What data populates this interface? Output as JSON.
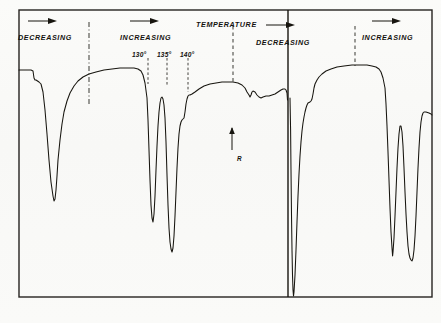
{
  "figure": {
    "title": "TEMPERATURE",
    "medium": "chart-recorder-trace",
    "ink_color": "#17150f",
    "paper_color": "#fbfbf9",
    "frame_color": "#262320"
  },
  "annotations": {
    "direction_labels": [
      {
        "id": "dec-1",
        "text": "DECREASING",
        "x": 18,
        "y": 33,
        "arrow_x": 50,
        "arrow_y": 21
      },
      {
        "id": "inc-1",
        "text": "INCREASING",
        "x": 120,
        "y": 33,
        "arrow_x": 152,
        "arrow_y": 21
      },
      {
        "id": "dec-2",
        "text": "DECREASING",
        "x": 256,
        "y": 38,
        "arrow_x": 288,
        "arrow_y": 25
      },
      {
        "id": "inc-2",
        "text": "INCREASING",
        "x": 362,
        "y": 33,
        "arrow_x": 394,
        "arrow_y": 21
      }
    ],
    "title_label": {
      "text": "TEMPERATURE",
      "x": 196,
      "y": 20
    },
    "temperature_marks": [
      {
        "label": "130°",
        "x": 132,
        "y": 51,
        "tick_x": 148,
        "tick_top": 58,
        "tick_bottom": 84
      },
      {
        "label": "135°",
        "x": 157,
        "y": 51,
        "tick_x": 167,
        "tick_top": 58,
        "tick_bottom": 86
      },
      {
        "label": "140°",
        "x": 180,
        "y": 51,
        "tick_x": 188,
        "tick_top": 58,
        "tick_bottom": 92
      }
    ],
    "sensitivity_marker": {
      "label": "R",
      "label_x": 237,
      "label_y": 155,
      "arrow_x": 232,
      "arrow_top": 128,
      "arrow_bottom": 150
    }
  },
  "chart_data": {
    "type": "line",
    "title": "TEMPERATURE",
    "subtitle": "",
    "xlabel": "",
    "ylabel": "",
    "grid": false,
    "legend": null,
    "xlim": [
      19,
      432
    ],
    "ylim": [
      298,
      60
    ],
    "axis_note": "y axis inverted: pen deflection downward = larger value",
    "annotation_texts": [
      "DECREASING",
      "INCREASING",
      "TEMPERATURE",
      "DECREASING",
      "INCREASING",
      "130°",
      "135°",
      "140°",
      "R"
    ],
    "series": [
      {
        "name": "recorder-trace-left-panel",
        "points": [
          [
            19,
            70
          ],
          [
            22,
            70
          ],
          [
            27,
            70
          ],
          [
            31,
            70
          ],
          [
            33,
            71
          ],
          [
            34,
            78
          ],
          [
            35,
            80
          ],
          [
            36,
            80
          ],
          [
            39,
            82
          ],
          [
            41,
            84
          ],
          [
            43,
            92
          ],
          [
            45,
            110
          ],
          [
            47,
            134
          ],
          [
            49,
            160
          ],
          [
            51,
            182
          ],
          [
            53,
            196
          ],
          [
            54,
            201
          ],
          [
            55,
            199
          ],
          [
            56,
            190
          ],
          [
            57,
            176
          ],
          [
            58,
            160
          ],
          [
            60,
            140
          ],
          [
            62,
            124
          ],
          [
            64,
            112
          ],
          [
            67,
            101
          ],
          [
            70,
            93
          ],
          [
            74,
            86
          ],
          [
            78,
            81
          ],
          [
            83,
            77
          ],
          [
            89,
            74
          ],
          [
            96,
            72
          ],
          [
            104,
            70
          ],
          [
            112,
            69
          ],
          [
            120,
            68
          ],
          [
            128,
            68
          ],
          [
            134,
            68
          ],
          [
            138,
            69
          ],
          [
            141,
            71
          ],
          [
            143,
            75
          ],
          [
            145,
            83
          ],
          [
            147,
            98
          ],
          [
            148,
            120
          ],
          [
            149,
            150
          ],
          [
            150,
            180
          ],
          [
            151,
            205
          ],
          [
            152,
            218
          ],
          [
            153,
            222
          ],
          [
            154,
            214
          ],
          [
            155,
            196
          ],
          [
            156,
            170
          ],
          [
            157,
            146
          ],
          [
            158,
            126
          ],
          [
            159,
            112
          ],
          [
            160,
            103
          ],
          [
            161,
            98
          ],
          [
            162,
            97
          ],
          [
            163,
            99
          ],
          [
            164,
            105
          ],
          [
            165,
            118
          ],
          [
            166,
            142
          ],
          [
            167,
            175
          ],
          [
            168,
            205
          ],
          [
            169,
            228
          ],
          [
            170,
            242
          ],
          [
            171,
            249
          ],
          [
            172,
            252
          ],
          [
            173,
            248
          ],
          [
            174,
            236
          ],
          [
            175,
            216
          ],
          [
            176,
            192
          ],
          [
            177,
            168
          ],
          [
            178,
            148
          ],
          [
            179,
            134
          ],
          [
            180,
            126
          ],
          [
            181,
            122
          ],
          [
            182,
            120
          ],
          [
            183,
            119
          ],
          [
            184,
            118
          ],
          [
            185,
            112
          ],
          [
            186,
            104
          ],
          [
            187,
            99
          ],
          [
            188,
            96
          ],
          [
            189,
            95
          ],
          [
            190,
            95
          ],
          [
            192,
            94
          ],
          [
            195,
            92
          ],
          [
            199,
            89
          ],
          [
            204,
            86
          ],
          [
            210,
            84
          ],
          [
            216,
            83
          ],
          [
            222,
            82
          ],
          [
            228,
            82
          ],
          [
            233,
            82
          ],
          [
            238,
            83
          ],
          [
            242,
            85
          ],
          [
            245,
            88
          ],
          [
            247,
            92
          ],
          [
            249,
            95
          ],
          [
            250,
            97
          ],
          [
            251,
            95
          ],
          [
            252,
            92
          ],
          [
            253,
            91
          ],
          [
            255,
            92
          ],
          [
            257,
            95
          ],
          [
            259,
            97
          ],
          [
            261,
            98
          ],
          [
            263,
            97
          ],
          [
            266,
            96
          ],
          [
            269,
            96
          ],
          [
            272,
            95
          ],
          [
            275,
            94
          ],
          [
            278,
            92
          ],
          [
            281,
            90
          ],
          [
            283,
            89
          ],
          [
            285,
            89
          ],
          [
            286,
            90
          ],
          [
            287,
            93
          ],
          [
            287.5,
            100
          ]
        ]
      },
      {
        "name": "recorder-trace-right-panel",
        "points": [
          [
            290,
            98
          ],
          [
            290.6,
            130
          ],
          [
            291,
            170
          ],
          [
            291.5,
            215
          ],
          [
            292,
            250
          ],
          [
            292.5,
            275
          ],
          [
            293,
            290
          ],
          [
            293.5,
            296
          ],
          [
            294,
            292
          ],
          [
            295,
            275
          ],
          [
            296,
            250
          ],
          [
            297,
            222
          ],
          [
            298,
            196
          ],
          [
            299,
            174
          ],
          [
            300,
            156
          ],
          [
            301,
            142
          ],
          [
            302,
            131
          ],
          [
            303,
            123
          ],
          [
            304,
            117
          ],
          [
            305,
            112
          ],
          [
            306,
            108
          ],
          [
            307,
            105
          ],
          [
            308,
            103
          ],
          [
            310,
            102
          ],
          [
            311,
            101
          ],
          [
            312,
            99
          ],
          [
            313,
            94
          ],
          [
            314,
            88
          ],
          [
            315,
            84
          ],
          [
            317,
            80
          ],
          [
            319,
            77
          ],
          [
            322,
            74
          ],
          [
            326,
            71
          ],
          [
            331,
            69
          ],
          [
            337,
            67
          ],
          [
            344,
            66
          ],
          [
            352,
            65
          ],
          [
            360,
            65
          ],
          [
            367,
            65
          ],
          [
            372,
            66
          ],
          [
            376,
            67
          ],
          [
            379,
            69
          ],
          [
            381,
            72
          ],
          [
            383,
            78
          ],
          [
            385,
            88
          ],
          [
            386,
            104
          ],
          [
            387,
            126
          ],
          [
            388,
            152
          ],
          [
            389,
            180
          ],
          [
            390,
            208
          ],
          [
            391,
            232
          ],
          [
            392,
            248
          ],
          [
            392.6,
            256
          ],
          [
            393,
            252
          ],
          [
            394,
            238
          ],
          [
            395,
            216
          ],
          [
            396,
            192
          ],
          [
            397,
            168
          ],
          [
            398,
            148
          ],
          [
            399,
            134
          ],
          [
            400,
            126
          ],
          [
            401,
            126
          ],
          [
            402,
            132
          ],
          [
            403,
            146
          ],
          [
            404,
            168
          ],
          [
            405,
            192
          ],
          [
            406,
            214
          ],
          [
            407,
            232
          ],
          [
            408,
            246
          ],
          [
            409,
            254
          ],
          [
            410,
            258
          ],
          [
            411,
            260
          ],
          [
            412,
            261
          ],
          [
            413,
            258
          ],
          [
            414,
            250
          ],
          [
            415,
            236
          ],
          [
            416,
            216
          ],
          [
            417,
            192
          ],
          [
            418,
            168
          ],
          [
            419,
            148
          ],
          [
            420,
            132
          ],
          [
            421,
            122
          ],
          [
            422,
            116
          ],
          [
            423,
            113
          ],
          [
            424,
            112
          ],
          [
            426,
            112
          ],
          [
            429,
            113
          ],
          [
            431,
            114
          ],
          [
            432,
            115
          ]
        ]
      }
    ],
    "reference_lines": [
      {
        "id": "dashdot-1",
        "x": 89,
        "y_top": 22,
        "y_bottom": 104,
        "style": "dash-dot"
      },
      {
        "id": "dashed-center",
        "x": 233,
        "y_top": 26,
        "y_bottom": 82,
        "style": "dashed"
      },
      {
        "id": "dashed-right",
        "x": 355,
        "y_top": 26,
        "y_bottom": 66,
        "style": "dashed"
      },
      {
        "id": "panel-divider",
        "x": 288,
        "y_top": 10,
        "y_bottom": 297,
        "style": "solid"
      }
    ],
    "frame": {
      "x": 19,
      "y": 10,
      "width": 413,
      "height": 287
    }
  }
}
